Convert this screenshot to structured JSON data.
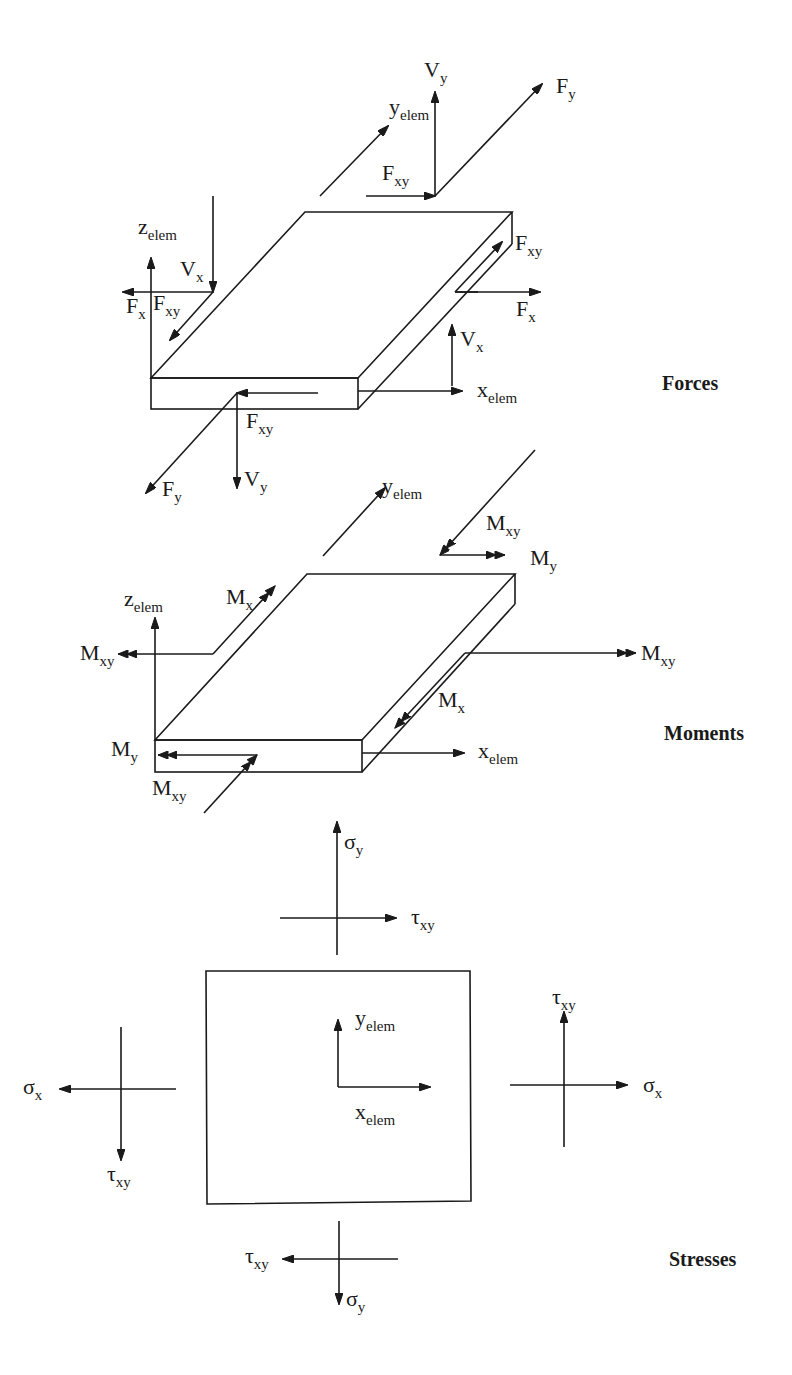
{
  "sections": {
    "forces": {
      "title": "Forces",
      "labels": {
        "z_elem": {
          "main": "z",
          "sub": "elem"
        },
        "y_elem": {
          "main": "y",
          "sub": "elem"
        },
        "x_elem": {
          "main": "x",
          "sub": "elem"
        },
        "Vy_top": {
          "main": "V",
          "sub": "y"
        },
        "Fy_top": {
          "main": "F",
          "sub": "y"
        },
        "Fxy_top": {
          "main": "F",
          "sub": "xy"
        },
        "Vx_left": {
          "main": "V",
          "sub": "x"
        },
        "Fx_left": {
          "main": "F",
          "sub": "x"
        },
        "Fxy_left": {
          "main": "F",
          "sub": "xy"
        },
        "Fxy_right": {
          "main": "F",
          "sub": "xy"
        },
        "Fx_right": {
          "main": "F",
          "sub": "x"
        },
        "Vx_right": {
          "main": "V",
          "sub": "x"
        },
        "Fxy_front": {
          "main": "F",
          "sub": "xy"
        },
        "Fy_bottom": {
          "main": "F",
          "sub": "y"
        },
        "Vy_bottom": {
          "main": "V",
          "sub": "y"
        }
      }
    },
    "moments": {
      "title": "Moments",
      "labels": {
        "y_elem": {
          "main": "y",
          "sub": "elem"
        },
        "z_elem": {
          "main": "z",
          "sub": "elem"
        },
        "x_elem": {
          "main": "x",
          "sub": "elem"
        },
        "Mxy_top": {
          "main": "M",
          "sub": "xy"
        },
        "My_top": {
          "main": "M",
          "sub": "y"
        },
        "Mx_top": {
          "main": "M",
          "sub": "x"
        },
        "Mxy_left": {
          "main": "M",
          "sub": "xy"
        },
        "Mxy_right": {
          "main": "M",
          "sub": "xy"
        },
        "Mx_right": {
          "main": "M",
          "sub": "x"
        },
        "My_left": {
          "main": "M",
          "sub": "y"
        },
        "Mxy_bottom": {
          "main": "M",
          "sub": "xy"
        }
      }
    },
    "stresses": {
      "title": "Stresses",
      "labels": {
        "sigma_y_top": {
          "main": "σ",
          "sub": "y"
        },
        "tau_xy_top": {
          "main": "τ",
          "sub": "xy"
        },
        "y_elem": {
          "main": "y",
          "sub": "elem"
        },
        "x_elem": {
          "main": "x",
          "sub": "elem"
        },
        "tau_xy_right": {
          "main": "τ",
          "sub": "xy"
        },
        "sigma_x_right": {
          "main": "σ",
          "sub": "x"
        },
        "sigma_x_left": {
          "main": "σ",
          "sub": "x"
        },
        "tau_xy_left": {
          "main": "τ",
          "sub": "xy"
        },
        "tau_xy_bottom": {
          "main": "τ",
          "sub": "xy"
        },
        "sigma_y_bottom": {
          "main": "σ",
          "sub": "y"
        }
      }
    }
  }
}
